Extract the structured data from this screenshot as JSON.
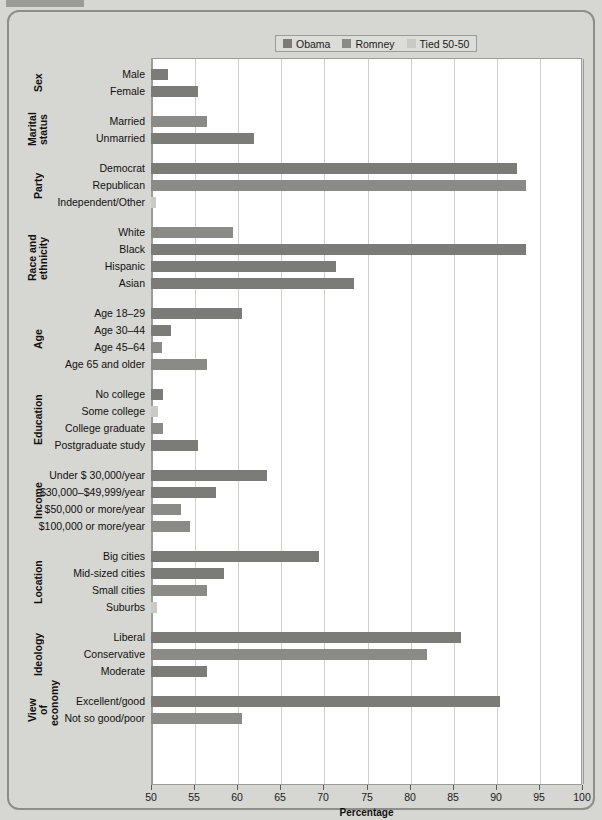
{
  "legend": {
    "items": [
      {
        "label": "Obama",
        "color": "#7b7b78"
      },
      {
        "label": "Romney",
        "color": "#8a8a86"
      },
      {
        "label": "Tied 50-50",
        "color": "#c9c9c5"
      }
    ]
  },
  "chart_data": {
    "type": "bar",
    "orientation": "horizontal",
    "title": "",
    "xlabel": "Percentage",
    "ylabel": "",
    "xlim": [
      50,
      100
    ],
    "xticks": [
      50,
      55,
      60,
      65,
      70,
      75,
      80,
      85,
      90,
      95,
      100
    ],
    "grid": true,
    "legend_position": "top",
    "series_names": [
      "Obama",
      "Romney",
      "Tied 50-50"
    ],
    "groups": [
      {
        "name": "Sex",
        "rows": [
          {
            "label": "Male",
            "value": 52.0,
            "series": "Obama"
          },
          {
            "label": "Female",
            "value": 55.5,
            "series": "Obama"
          }
        ]
      },
      {
        "name": "Marital\nstatus",
        "rows": [
          {
            "label": "Married",
            "value": 56.5,
            "series": "Romney"
          },
          {
            "label": "Unmarried",
            "value": 62.0,
            "series": "Obama"
          }
        ]
      },
      {
        "name": "Party",
        "rows": [
          {
            "label": "Democrat",
            "value": 92.5,
            "series": "Obama"
          },
          {
            "label": "Republican",
            "value": 93.5,
            "series": "Romney"
          },
          {
            "label": "Independent/Other",
            "value": 50.6,
            "series": "Tied 50-50"
          }
        ]
      },
      {
        "name": "Race and\nethnicity",
        "rows": [
          {
            "label": "White",
            "value": 59.5,
            "series": "Romney"
          },
          {
            "label": "Black",
            "value": 93.5,
            "series": "Obama"
          },
          {
            "label": "Hispanic",
            "value": 71.5,
            "series": "Obama"
          },
          {
            "label": "Asian",
            "value": 73.5,
            "series": "Obama"
          }
        ]
      },
      {
        "name": "Age",
        "rows": [
          {
            "label": "Age 18–29",
            "value": 60.5,
            "series": "Obama"
          },
          {
            "label": "Age 30–44",
            "value": 52.3,
            "series": "Obama"
          },
          {
            "label": "Age 45–64",
            "value": 51.3,
            "series": "Romney"
          },
          {
            "label": "Age 65 and older",
            "value": 56.5,
            "series": "Romney"
          }
        ]
      },
      {
        "name": "Education",
        "rows": [
          {
            "label": "No college",
            "value": 51.4,
            "series": "Obama"
          },
          {
            "label": "Some college",
            "value": 50.8,
            "series": "Tied 50-50"
          },
          {
            "label": "College graduate",
            "value": 51.4,
            "series": "Romney"
          },
          {
            "label": "Postgraduate study",
            "value": 55.5,
            "series": "Obama"
          }
        ]
      },
      {
        "name": "Income",
        "rows": [
          {
            "label": "Under $ 30,000/year",
            "value": 63.5,
            "series": "Obama"
          },
          {
            "label": "$30,000–$49,999/year",
            "value": 57.5,
            "series": "Obama"
          },
          {
            "label": "$50,000 or more/year",
            "value": 53.5,
            "series": "Romney"
          },
          {
            "label": "$100,000 or more/year",
            "value": 54.5,
            "series": "Romney"
          }
        ]
      },
      {
        "name": "Location",
        "rows": [
          {
            "label": "Big cities",
            "value": 69.5,
            "series": "Obama"
          },
          {
            "label": "Mid-sized cities",
            "value": 58.5,
            "series": "Obama"
          },
          {
            "label": "Small cities",
            "value": 56.5,
            "series": "Romney"
          },
          {
            "label": "Suburbs",
            "value": 50.7,
            "series": "Tied 50-50"
          }
        ]
      },
      {
        "name": "Ideology",
        "rows": [
          {
            "label": "Liberal",
            "value": 86.0,
            "series": "Obama"
          },
          {
            "label": "Conservative",
            "value": 82.0,
            "series": "Romney"
          },
          {
            "label": "Moderate",
            "value": 56.5,
            "series": "Obama"
          }
        ]
      },
      {
        "name": "View of\neconomy",
        "rows": [
          {
            "label": "Excellent/good",
            "value": 90.5,
            "series": "Obama"
          },
          {
            "label": "Not so good/poor",
            "value": 60.5,
            "series": "Romney"
          }
        ]
      }
    ]
  }
}
